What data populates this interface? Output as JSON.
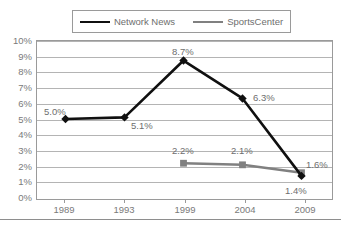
{
  "chart_data": {
    "type": "line",
    "title": "",
    "xlabel": "",
    "ylabel": "",
    "categories": [
      "1989",
      "1993",
      "1999",
      "2004",
      "2009"
    ],
    "ylim": [
      0,
      10
    ],
    "ytick_labels": [
      "0%",
      "1%",
      "2%",
      "3%",
      "4%",
      "5%",
      "6%",
      "7%",
      "8%",
      "9%",
      "10%"
    ],
    "ytick_values": [
      0,
      1,
      2,
      3,
      4,
      5,
      6,
      7,
      8,
      9,
      10
    ],
    "grid": true,
    "legend_position": "top",
    "series": [
      {
        "name": "Network News",
        "color": "#101010",
        "marker": "diamond",
        "x": [
          "1989",
          "1993",
          "1999",
          "2004",
          "2009"
        ],
        "values": [
          5.0,
          5.1,
          8.7,
          6.3,
          1.4
        ],
        "data_labels": [
          "5.0%",
          "5.1%",
          "8.7%",
          "6.3%",
          "1.4%"
        ]
      },
      {
        "name": "SportsCenter",
        "color": "#808080",
        "marker": "square",
        "x": [
          "1999",
          "2004",
          "2009"
        ],
        "values": [
          2.2,
          2.1,
          1.6
        ],
        "data_labels": [
          "2.2%",
          "2.1%",
          "1.6%"
        ]
      }
    ]
  },
  "legend": {
    "entries": [
      {
        "label": "Network News"
      },
      {
        "label": "SportsCenter"
      }
    ]
  },
  "axes": {
    "y": {
      "ticks": [
        {
          "label": "10%"
        },
        {
          "label": "9%"
        },
        {
          "label": "8%"
        },
        {
          "label": "7%"
        },
        {
          "label": "6%"
        },
        {
          "label": "5%"
        },
        {
          "label": "4%"
        },
        {
          "label": "3%"
        },
        {
          "label": "2%"
        },
        {
          "label": "1%"
        },
        {
          "label": "0%"
        }
      ]
    },
    "x": {
      "ticks": [
        {
          "label": "1989"
        },
        {
          "label": "1993"
        },
        {
          "label": "1999"
        },
        {
          "label": "2004"
        },
        {
          "label": "2009"
        }
      ]
    }
  },
  "data_labels": {
    "nn_1989": "5.0%",
    "nn_1993": "5.1%",
    "nn_1999": "8.7%",
    "nn_2004": "6.3%",
    "nn_2009": "1.4%",
    "sc_1999": "2.2%",
    "sc_2004": "2.1%",
    "sc_2009": "1.6%"
  },
  "colors": {
    "network_news": "#101010",
    "sportscenter": "#808080",
    "gridline": "#b4b4b4",
    "axis": "#9a9a9a",
    "text": "#7a7a7a"
  }
}
